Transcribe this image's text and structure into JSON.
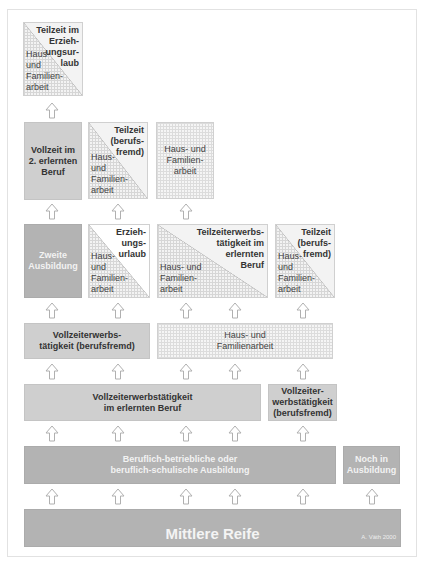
{
  "diagram": {
    "credit": "A. Väth 2000",
    "rows": [
      {
        "row": 1,
        "boxes": [
          {
            "id": "r1b1",
            "type": "split",
            "top_right": "Teilzeit im\nErzieh-\nungsur-\nlaub",
            "bottom_left": "Haus-\nund\nFamilien-\narbeit"
          }
        ]
      },
      {
        "row": 2,
        "boxes": [
          {
            "id": "r2b1",
            "type": "solid",
            "label": "Vollzeit im\n2. erlernten\nBeruf"
          },
          {
            "id": "r2b2",
            "type": "split",
            "top_right": "Teilzeit\n(berufs-\nfremd)",
            "bottom_left": "Haus-\nund\nFamilien-\narbeit"
          },
          {
            "id": "r2b3",
            "type": "hatched",
            "label": "Haus- und\nFamilien-\narbeit"
          }
        ]
      },
      {
        "row": 3,
        "boxes": [
          {
            "id": "r3b1",
            "type": "dark",
            "label": "Zweite\nAusbildung"
          },
          {
            "id": "r3b2",
            "type": "split",
            "top_right": "Erzieh-\nungs-\nurlaub",
            "bottom_left": "Haus-\nund\nFamilien-\narbeit"
          },
          {
            "id": "r3b3",
            "type": "split",
            "top_right": "Teilzeiterwerbs-\ntätigkeit im\nerlernten\nBeruf",
            "bottom_left": "Haus- und\nFamilien-\narbeit"
          },
          {
            "id": "r3b4",
            "type": "split",
            "top_right": "Teilzeit\n(berufs-\nfremd)",
            "bottom_left": "Haus-\nund\nFamilien-\narbeit"
          }
        ]
      },
      {
        "row": 4,
        "boxes": [
          {
            "id": "r4b1",
            "type": "solid",
            "label": "Vollzeiterwerbs-\ntätigkeit (berufsfremd)"
          },
          {
            "id": "r4b2",
            "type": "hatched",
            "label": "Haus- und\nFamilienarbeit"
          }
        ]
      },
      {
        "row": 5,
        "boxes": [
          {
            "id": "r5b1",
            "type": "solid",
            "label": "Vollzeiterwerbstätigkeit\nim erlernten Beruf"
          },
          {
            "id": "r5b2",
            "type": "solid",
            "label": "Vollzeiter-\nwerbstätigkeit\n(berufsfremd)"
          }
        ]
      },
      {
        "row": 6,
        "boxes": [
          {
            "id": "r6b1",
            "type": "dark",
            "label": "Beruflich-betriebliche oder\nberuflich-schulische Ausbildung"
          },
          {
            "id": "r6b2",
            "type": "dark",
            "label": "Noch in\nAusbildung"
          }
        ]
      },
      {
        "row": 7,
        "boxes": [
          {
            "id": "r7b1",
            "type": "dark",
            "label": "Mittlere Reife"
          }
        ]
      }
    ],
    "arrow_icon": "up-arrow-outline-icon",
    "colors": {
      "solid": "#cfcfcf",
      "dark": "#b3b3b3",
      "hatched": "#f5f5f5",
      "arrow_stroke": "#b0b0b0"
    }
  }
}
